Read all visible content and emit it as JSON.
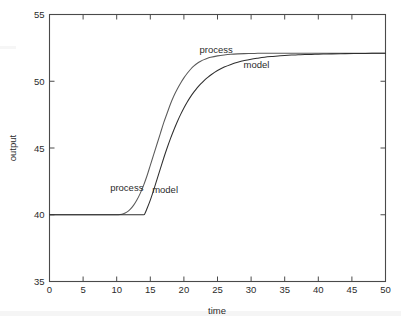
{
  "chart_data": {
    "type": "line",
    "title": "",
    "xlabel": "time",
    "ylabel": "output",
    "xlim": [
      0,
      50
    ],
    "ylim": [
      35,
      55
    ],
    "xticks": [
      0,
      5,
      10,
      15,
      20,
      25,
      30,
      35,
      40,
      45,
      50
    ],
    "yticks": [
      35,
      40,
      45,
      50,
      55
    ],
    "grid": false,
    "legend_position": "inline-annotations",
    "annotations": [
      {
        "text": "process",
        "x": 11.5,
        "y": 41.8
      },
      {
        "text": "model",
        "x": 17.2,
        "y": 41.6
      },
      {
        "text": "process",
        "x": 24.8,
        "y": 52.1
      },
      {
        "text": "model",
        "x": 30.8,
        "y": 51.0
      }
    ],
    "series": [
      {
        "name": "process",
        "color": "#5a5a5a",
        "x": [
          0,
          1,
          2,
          3,
          4,
          5,
          6,
          7,
          8,
          9,
          10,
          10.5,
          11,
          11.5,
          12,
          12.5,
          13,
          13.5,
          14,
          14.5,
          15,
          15.5,
          16,
          16.5,
          17,
          17.5,
          18,
          18.5,
          19,
          19.5,
          20,
          20.5,
          21,
          21.5,
          22,
          22.5,
          23,
          23.5,
          24,
          25,
          26,
          27,
          28,
          29,
          30,
          31,
          32,
          33,
          34,
          35,
          36,
          37,
          38,
          39,
          40,
          42,
          44,
          46,
          48,
          50
        ],
        "y": [
          40.0,
          40.0,
          40.0,
          40.0,
          40.0,
          40.0,
          40.0,
          40.0,
          40.0,
          40.0,
          40.0,
          40.02,
          40.08,
          40.2,
          40.4,
          40.7,
          41.1,
          41.6,
          42.2,
          42.9,
          43.7,
          44.5,
          45.3,
          46.1,
          46.9,
          47.6,
          48.3,
          48.9,
          49.4,
          49.85,
          50.25,
          50.6,
          50.9,
          51.15,
          51.35,
          51.5,
          51.62,
          51.72,
          51.8,
          51.9,
          51.97,
          52.02,
          52.05,
          52.07,
          52.08,
          52.09,
          52.1,
          52.1,
          52.1,
          52.1,
          52.1,
          52.1,
          52.1,
          52.1,
          52.1,
          52.1,
          52.1,
          52.1,
          52.1,
          52.1
        ]
      },
      {
        "name": "model",
        "color": "#2e2e2e",
        "x": [
          0,
          2,
          4,
          6,
          8,
          10,
          12,
          13,
          14,
          14.2,
          14.5,
          15,
          15.5,
          16,
          16.5,
          17,
          17.5,
          18,
          18.5,
          19,
          19.5,
          20,
          20.5,
          21,
          21.5,
          22,
          22.5,
          23,
          23.5,
          24,
          25,
          26,
          27,
          28,
          29,
          30,
          31,
          32,
          33,
          34,
          35,
          36,
          37,
          38,
          39,
          40,
          41,
          42,
          44,
          46,
          48,
          50
        ],
        "y": [
          40.0,
          40.0,
          40.0,
          40.0,
          40.0,
          40.0,
          40.0,
          40.0,
          40.0,
          40.1,
          40.45,
          41.1,
          41.85,
          42.65,
          43.45,
          44.25,
          45.0,
          45.7,
          46.35,
          46.95,
          47.5,
          48.0,
          48.45,
          48.85,
          49.2,
          49.52,
          49.8,
          50.05,
          50.27,
          50.47,
          50.8,
          51.06,
          51.26,
          51.42,
          51.55,
          51.65,
          51.73,
          51.8,
          51.85,
          51.89,
          51.93,
          51.96,
          51.98,
          52.0,
          52.01,
          52.03,
          52.04,
          52.05,
          52.07,
          52.08,
          52.09,
          52.1
        ]
      }
    ]
  },
  "axes": {
    "x_tick_labels": [
      "0",
      "5",
      "10",
      "15",
      "20",
      "25",
      "30",
      "35",
      "40",
      "45",
      "50"
    ],
    "y_tick_labels": [
      "35",
      "40",
      "45",
      "50",
      "55"
    ],
    "x_title": "time",
    "y_title": "output"
  }
}
